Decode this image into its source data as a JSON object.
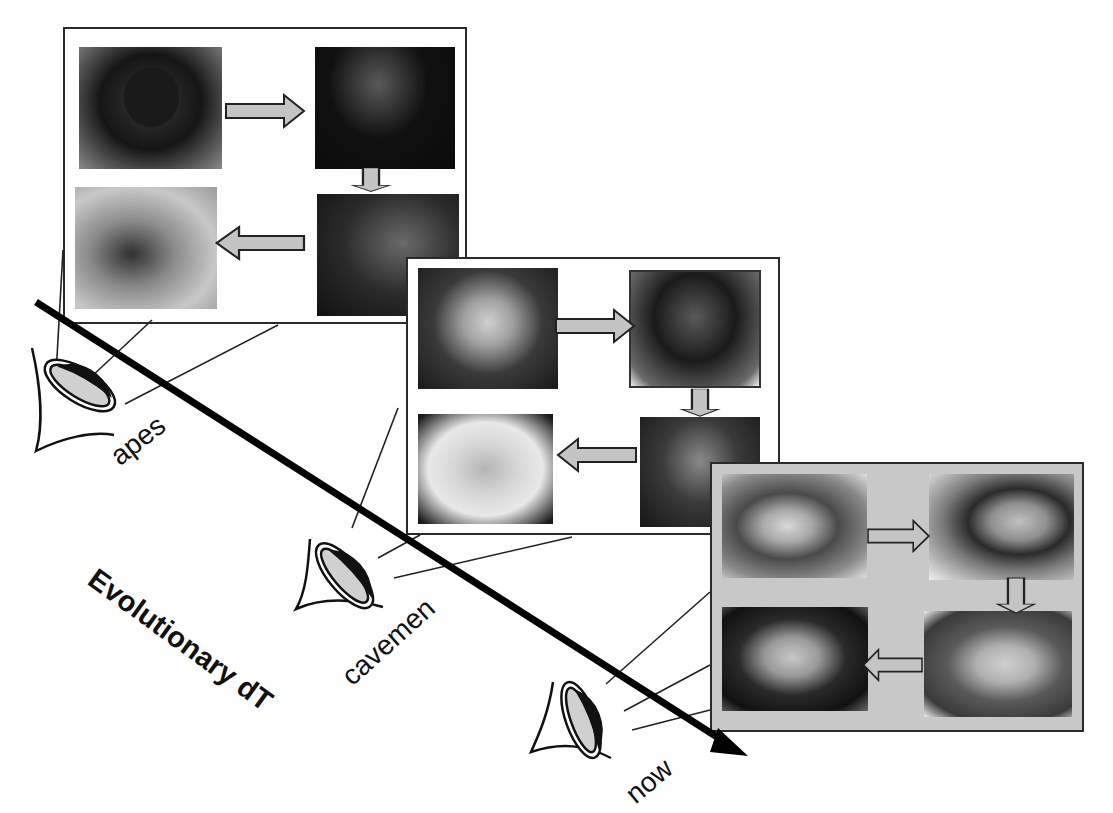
{
  "diagram": {
    "axis_label": "Evolutionary dT",
    "timeline": [
      {
        "id": "apes",
        "observer_label": "apes",
        "panel_style": "white",
        "photos": [
          "young ape",
          "adult ape",
          "mature ape",
          "old ape"
        ]
      },
      {
        "id": "cavemen",
        "observer_label": "cavemen",
        "panel_style": "white",
        "photos": [
          "caveman child",
          "caveman adult",
          "caveman middle-aged",
          "caveman elder"
        ]
      },
      {
        "id": "now",
        "observer_label": "now",
        "panel_style": "gray",
        "photos": [
          "girl",
          "woman",
          "older woman",
          "elderly woman"
        ]
      }
    ],
    "cycle_order": [
      "top-left",
      "top-right",
      "bottom-right",
      "bottom-left"
    ],
    "icons": {
      "observer": "eye-icon",
      "flow_arrow": "block-arrow-icon",
      "time_axis": "long-arrow-icon"
    },
    "colors": {
      "ink": "#111111",
      "arrow_fill": "#c4c4c4",
      "panel_now_bg": "#c8c8c8",
      "eye_iris": "#d0d0d0"
    }
  }
}
